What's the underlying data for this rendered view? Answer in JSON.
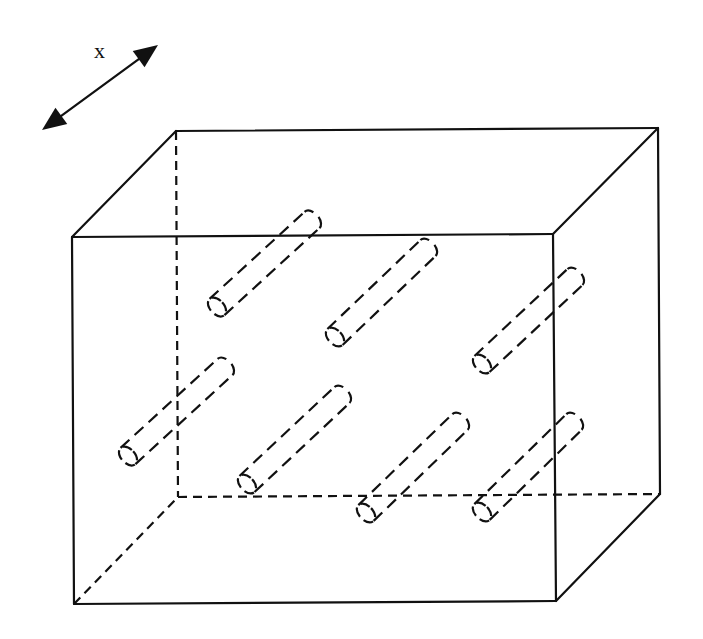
{
  "diagram": {
    "title": "",
    "axis": {
      "label": "x",
      "label_pos": [
        100,
        58
      ],
      "arrow_start": [
        42,
        130
      ],
      "arrow_end": [
        158,
        45
      ]
    },
    "box": {
      "front": {
        "tl": [
          72,
          237
        ],
        "tr": [
          553,
          234
        ],
        "br": [
          556,
          601
        ],
        "bl": [
          74,
          604
        ]
      },
      "back": {
        "tl": [
          176,
          131
        ],
        "tr": [
          658,
          128
        ],
        "br": [
          660,
          494
        ],
        "bl": [
          178,
          497
        ]
      },
      "visible_edges": "solid",
      "hidden_edges": "dashed"
    },
    "cylinders": [
      {
        "id": 1,
        "front": [
          217,
          307
        ],
        "back": [
          312,
          220
        ]
      },
      {
        "id": 2,
        "front": [
          335,
          337
        ],
        "back": [
          428,
          248
        ]
      },
      {
        "id": 3,
        "front": [
          482,
          364
        ],
        "back": [
          575,
          277
        ]
      },
      {
        "id": 4,
        "front": [
          128,
          456
        ],
        "back": [
          225,
          367
        ]
      },
      {
        "id": 5,
        "front": [
          247,
          484
        ],
        "back": [
          342,
          395
        ]
      },
      {
        "id": 6,
        "front": [
          366,
          513
        ],
        "back": [
          460,
          422
        ]
      },
      {
        "id": 7,
        "front": [
          482,
          512
        ],
        "back": [
          574,
          422
        ]
      }
    ],
    "cylinder_style": "dashed",
    "cylinder_radius": 11,
    "colors": {
      "line": "#111111",
      "background": "#ffffff"
    }
  }
}
